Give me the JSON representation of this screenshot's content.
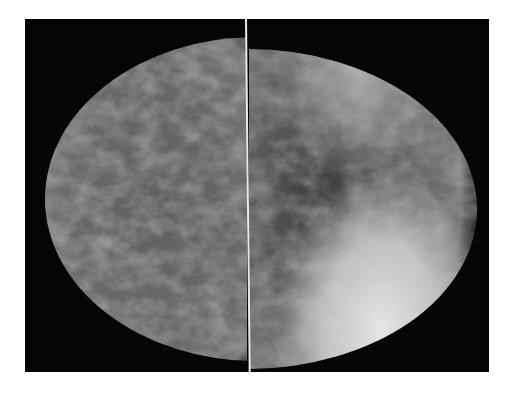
{
  "image": {
    "description": "Bilateral mammogram, two breast views side by side separated by a vertical white line",
    "colors": {
      "background": "#ffffff",
      "film": "#050505",
      "tissue_mid": "#6e6e6e",
      "tissue_bright": "#d8d8d8",
      "divider": "#e8e8e8"
    }
  }
}
